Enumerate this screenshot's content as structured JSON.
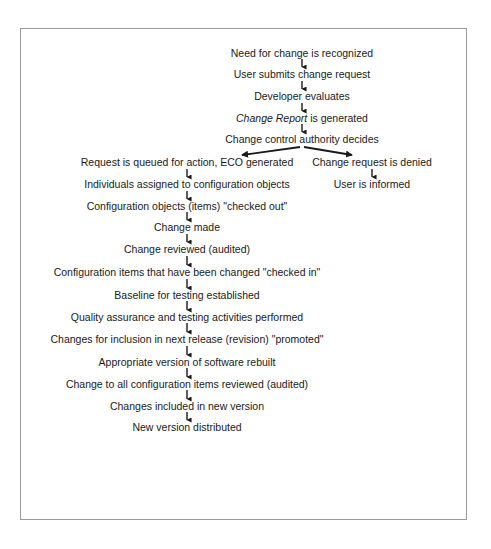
{
  "diagram": {
    "type": "flowchart",
    "top_sequence": [
      {
        "id": "n1",
        "text": "Need for change is recognized"
      },
      {
        "id": "n2",
        "text": "User submits change request"
      },
      {
        "id": "n3",
        "text": "Developer evaluates"
      },
      {
        "id": "n4",
        "text_italic": "Change Report",
        "text_rest": " is generated"
      },
      {
        "id": "n5",
        "text": "Change control authority decides"
      }
    ],
    "left_branch": [
      {
        "id": "l1",
        "text": "Request is queued for action, ECO generated"
      },
      {
        "id": "l2",
        "text": "Individuals assigned to configuration objects"
      },
      {
        "id": "l3",
        "text": "Configuration objects (items) \"checked out\""
      },
      {
        "id": "l4",
        "text": "Change made"
      },
      {
        "id": "l5",
        "text": "Change reviewed (audited)"
      },
      {
        "id": "l6",
        "text": "Configuration items that have been changed \"checked in\""
      },
      {
        "id": "l7",
        "text": "Baseline for testing established"
      },
      {
        "id": "l8",
        "text": "Quality assurance and testing activities performed"
      },
      {
        "id": "l9",
        "text": "Changes for inclusion in next release (revision) \"promoted\""
      },
      {
        "id": "l10",
        "text": "Appropriate version of software rebuilt"
      },
      {
        "id": "l11",
        "text": "Change to all configuration items reviewed (audited)"
      },
      {
        "id": "l12",
        "text": "Changes included in new version"
      },
      {
        "id": "l13",
        "text": "New version distributed"
      }
    ],
    "right_branch": [
      {
        "id": "r1",
        "text": "Change request is denied"
      },
      {
        "id": "r2",
        "text": "User is informed"
      }
    ]
  }
}
